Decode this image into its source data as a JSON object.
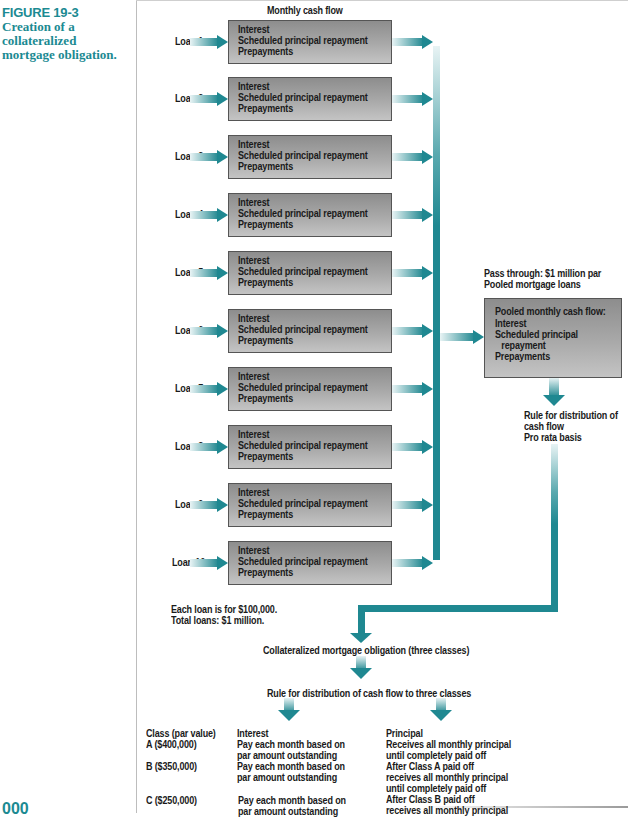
{
  "caption": {
    "figure_number": "FIGURE 19-3",
    "title": "Creation of a collateralized mortgage obligation."
  },
  "header": {
    "monthly_cash_flow": "Monthly cash flow"
  },
  "cash_flow_items": [
    "Interest",
    "Scheduled principal repayment",
    "Prepayments"
  ],
  "loans": [
    {
      "label": "Loan 1"
    },
    {
      "label": "Loan 2"
    },
    {
      "label": "Loan 3"
    },
    {
      "label": "Loan 4"
    },
    {
      "label": "Loan 5"
    },
    {
      "label": "Loan 6"
    },
    {
      "label": "Loan 7"
    },
    {
      "label": "Loan 8"
    },
    {
      "label": "Loan 9"
    },
    {
      "label": "Loan 10"
    }
  ],
  "pass_through": {
    "line1": "Pass through: $1 million par",
    "line2": "Pooled mortgage loans"
  },
  "pool_box": {
    "title": "Pooled monthly cash flow:",
    "items": [
      "Interest",
      "Scheduled principal",
      "repayment",
      "Prepayments"
    ]
  },
  "pro_rata_rule": {
    "line1": "Rule for distribution of",
    "line2": "cash flow",
    "line3": "Pro rata basis"
  },
  "loan_note": {
    "line1": "Each loan is for $100,000.",
    "line2": "Total loans: $1 million."
  },
  "cmo_label": "Collateralized mortgage obligation (three classes)",
  "distribution_rule": "Rule for distribution of cash flow to three classes",
  "classes_table": {
    "headers": {
      "class": "Class (par value)",
      "interest": "Interest",
      "principal": "Principal"
    },
    "rows": [
      {
        "class": "A ($400,000)",
        "interest": [
          "Pay each month based on",
          "par amount outstanding"
        ],
        "principal": [
          "Receives all monthly principal",
          "until completely paid off"
        ]
      },
      {
        "class": "B ($350,000)",
        "interest": [
          "Pay each month based on",
          "par amount outstanding"
        ],
        "principal": [
          "After Class A paid off",
          "receives all monthly principal",
          "until completely paid off"
        ]
      },
      {
        "class": "C ($250,000)",
        "interest": [
          "Pay each month based on",
          "par amount outstanding"
        ],
        "principal": [
          "After Class B paid off",
          "receives all monthly principal"
        ]
      }
    ]
  },
  "page_number": "000",
  "colors": {
    "accent_teal": "#1f8891",
    "caption_teal": "#1b8a92",
    "box_gray": "#a9a9a9"
  }
}
